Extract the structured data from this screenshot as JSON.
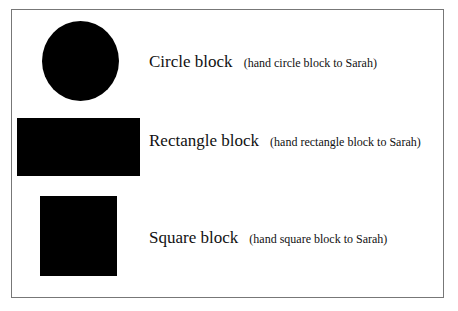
{
  "page": {
    "items": [
      {
        "shape": "circle",
        "label": "Circle block",
        "instruction": "(hand circle block to Sarah)"
      },
      {
        "shape": "rectangle",
        "label": "Rectangle block",
        "instruction": "(hand rectangle block to Sarah)"
      },
      {
        "shape": "square",
        "label": "Square block",
        "instruction": "(hand square block to Sarah)"
      }
    ],
    "colors": {
      "shape_fill": "#000000",
      "border": "#777777",
      "background": "#ffffff"
    }
  }
}
